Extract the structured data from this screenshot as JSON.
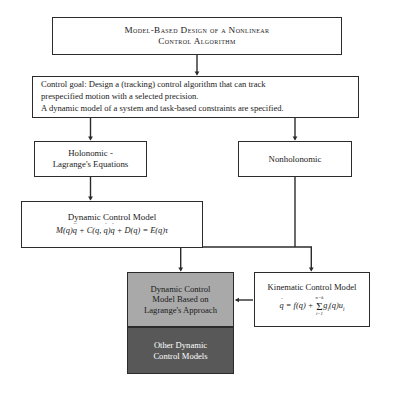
{
  "diagram": {
    "title_box": {
      "name": "model-based-design-title",
      "line1": "Model-Based Design of a Nonlinear",
      "line2": "Control Algorithm"
    },
    "goal_box": {
      "name": "control-goal",
      "line1": "Control goal: Design a (tracking) control algorithm that can track",
      "line2": "prespecified motion with a selected precision.",
      "line3": "A dynamic model of a system and task-based constraints are specified."
    },
    "holonomic_box": {
      "line1": "Holonomic -",
      "line2": "Lagrange's Equations"
    },
    "nonholonomic_box": {
      "line1": "Nonholonomic"
    },
    "dynamic_control_model_box": {
      "title": "Dynamic Control Model",
      "equation_text": "M(q)q̈ + C(q, q̇)q̇ + D(q) = E(q)τ",
      "equation_parts": {
        "m": "M",
        "q": "q",
        "c": "C",
        "d": "D",
        "e": "E",
        "tau": "τ"
      }
    },
    "gray_box": {
      "line1": "Dynamic Control",
      "line2": "Model Based on",
      "line3": "Lagrange's Approach",
      "fill_color": "#a9a9a9"
    },
    "dark_box": {
      "line1": "Other Dynamic",
      "line2": "Control Models",
      "fill_color": "#585858",
      "text_color": "#ffffff"
    },
    "kinematic_box": {
      "title": "Kinematic Control Model",
      "equation_text": "q̇ = f(q) + Σ(i=1..n−k) g_i(q)u_i",
      "equation_parts": {
        "qdot": "q",
        "f": "f",
        "sum_upper": "n−k",
        "sum_lower": "i=1",
        "g": "g",
        "u": "u",
        "idx": "i"
      }
    },
    "colors": {
      "stroke": "#2b2b2b",
      "background": "#ffffff",
      "gray_fill": "#a9a9a9",
      "dark_fill": "#585858"
    }
  }
}
